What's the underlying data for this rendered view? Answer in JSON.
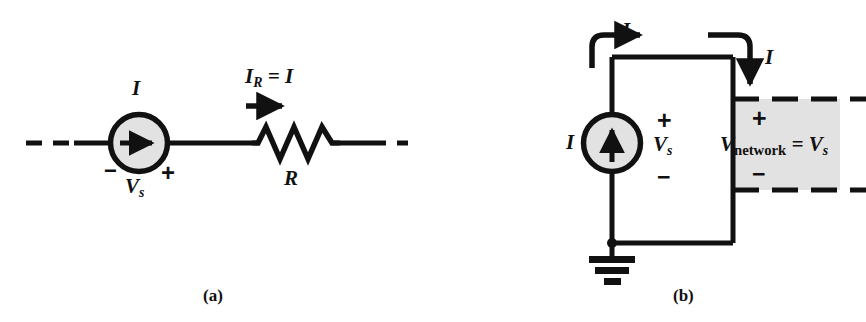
{
  "figure": {
    "background_color": "#ffffff",
    "line_color": "#111111",
    "fill_color": "#e2e2e2"
  },
  "panel_a": {
    "caption": "(a)",
    "source": {
      "current_label": "I",
      "voltage_label_base": "V",
      "voltage_label_sub": "s",
      "minus_sign": "−",
      "plus_sign": "+",
      "arrow_direction": "right",
      "shape": "circle"
    },
    "resistor": {
      "label": "R",
      "current_label_base": "I",
      "current_label_sub": "R",
      "current_label_rest": " = I",
      "arrow_direction": "right"
    }
  },
  "panel_b": {
    "caption": "(b)",
    "source": {
      "current_label": "I",
      "voltage_label_base": "V",
      "voltage_label_sub": "s",
      "plus_sign": "+",
      "minus_sign": "−",
      "arrow_direction": "up",
      "shape": "circle"
    },
    "top_left_current_label": "I",
    "top_right_current_label": "I",
    "network": {
      "voltage_base": "V",
      "voltage_sub": "network",
      "voltage_rest": " = V",
      "voltage_rest_sub": "s",
      "plus_sign": "+",
      "minus_sign": "−"
    },
    "ground": {
      "name": "ground-symbol"
    }
  }
}
